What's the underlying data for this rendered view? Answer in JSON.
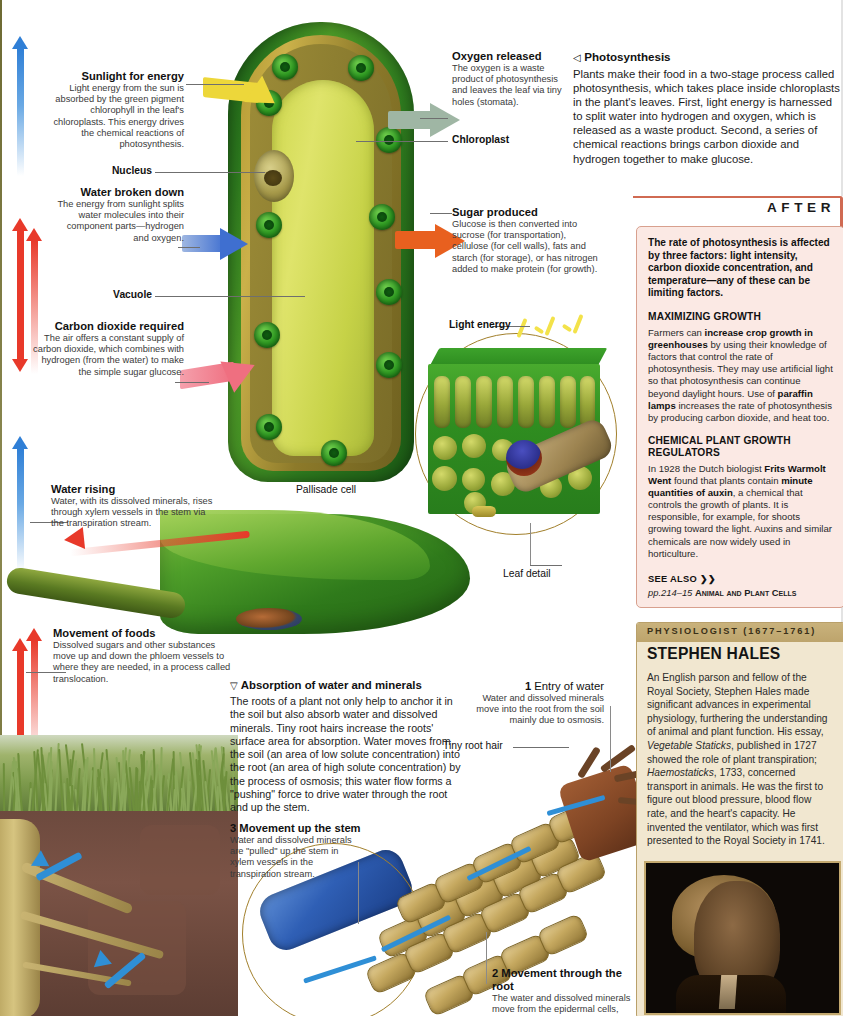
{
  "left_annotations": [
    {
      "id": "sunlight",
      "heading": "Sunlight for energy",
      "body": "Light energy from the sun is absorbed by the green pigment chlorophyll in the leaf's chloroplasts. This energy drives the chemical reactions of photosynthesis."
    },
    {
      "id": "water_broken_down",
      "heading": "Water broken down",
      "body": "The energy from sunlight splits water molecules into their component parts—hydrogen and oxygen."
    },
    {
      "id": "carbon_dioxide",
      "heading": "Carbon dioxide required",
      "body": "The air offers a constant supply of carbon dioxide, which combines with hydrogen (from the water) to make the simple sugar glucose."
    },
    {
      "id": "water_rising",
      "heading": "Water rising",
      "body": "Water, with its dissolved minerals, rises through xylem vessels in the stem via the transpiration stream."
    },
    {
      "id": "movement_of_foods",
      "heading": "Movement of foods",
      "body": "Dissolved sugars and other substances move up and down the phloem vessels to where they are needed, in a process called translocation."
    }
  ],
  "right_annotations": [
    {
      "id": "oxygen_released",
      "heading": "Oxygen released",
      "body": "The oxygen is a waste product of photosynthesis and leaves the leaf via tiny holes (stomata)."
    },
    {
      "id": "sugar_produced",
      "heading": "Sugar produced",
      "body": "Glucose is then converted into sucrose (for transportation), cellulose (for cell walls), fats and starch (for storage), or has nitrogen added to make protein (for growth)."
    }
  ],
  "pointer_labels": {
    "nucleus": "Nucleus",
    "vacuole": "Vacuole",
    "chloroplast": "Chloroplast",
    "light_energy": "Light energy",
    "pallisade_cell": "Pallisade cell",
    "leaf_detail": "Leaf detail",
    "tiny_root_hair": "Tiny root hair"
  },
  "intro": {
    "marker": "◁",
    "title": "Photosynthesis",
    "body": "Plants make their food in a two-stage process called photosynthesis, which takes place inside chloroplasts in the plant's leaves. First, light energy is harnessed to split water into hydrogen and oxygen, which is released as a waste product. Second, a series of chemical reactions brings carbon dioxide and hydrogen together to make glucose."
  },
  "absorption": {
    "marker": "▽",
    "title": "Absorption of water and minerals",
    "body": "The roots of a plant not only help to anchor it in the soil but also absorb water and dissolved minerals. Tiny root hairs increase the roots' surface area for absorption. Water moves from the soil (an area of low solute concentration) into the root (an area of high solute concentration) by the process of osmosis; this water flow forms a \"pushing\" force to drive water through the root and up the stem."
  },
  "numbered_steps": [
    {
      "number": "1",
      "heading": "Entry of water",
      "body": "Water and dissolved minerals move into the root from the soil mainly due to osmosis."
    },
    {
      "number": "2",
      "heading": "Movement through the root",
      "body": "The water and dissolved minerals move from the epidermal cells, through the cortex and into"
    },
    {
      "number": "3",
      "heading": "Movement up the stem",
      "body": "Water and dissolved minerals are \"pulled\" up the stem in xylem vessels in the transpiration stream."
    }
  ],
  "after_panel": {
    "tab_label": "AFTER",
    "lead": "The rate of photosynthesis is affected by three factors: light intensity, carbon dioxide concentration, and temperature—any of these can be limiting factors.",
    "sections": [
      {
        "heading": "MAXIMIZING GROWTH",
        "body_parts": [
          {
            "text": "Farmers can ",
            "bold": false
          },
          {
            "text": "increase crop growth in greenhouses",
            "bold": true
          },
          {
            "text": " by using their knowledge of factors that control the rate of photosynthesis. They may use artificial light so that photosynthesis can continue beyond daylight hours. Use of ",
            "bold": false
          },
          {
            "text": "paraffin lamps",
            "bold": true
          },
          {
            "text": " increases the rate of photosynthesis by producing carbon dioxide, and heat too.",
            "bold": false
          }
        ]
      },
      {
        "heading": "CHEMICAL PLANT GROWTH REGULATORS",
        "body_parts": [
          {
            "text": "In 1928 the Dutch biologist ",
            "bold": false
          },
          {
            "text": "Frits Warmolt Went",
            "bold": true
          },
          {
            "text": " found that plants contain ",
            "bold": false
          },
          {
            "text": "minute quantities of auxin",
            "bold": true
          },
          {
            "text": ", a chemical that controls the growth of plants. It is responsible, for example, for shoots growing toward the light. Auxins and similar chemicals are now widely used in horticulture.",
            "bold": false
          }
        ]
      }
    ],
    "see_also_label": "SEE ALSO ❯❯",
    "see_also_ref": "pp.214–15",
    "see_also_title": "Animal and Plant Cells"
  },
  "biography": {
    "kicker": "PHYSIOLOGIST (1677–1761)",
    "name": "STEPHEN HALES",
    "body_parts": [
      {
        "text": "An English parson and fellow of the Royal Society, Stephen Hales made significant advances in experimental physiology, furthering the understanding of animal and plant function. His essay, ",
        "italic": false
      },
      {
        "text": "Vegetable Staticks",
        "italic": true
      },
      {
        "text": ", published in 1727 showed the role of plant transpiration; ",
        "italic": false
      },
      {
        "text": "Haemostaticks",
        "italic": true
      },
      {
        "text": ", 1733, concerned transport in animals. He was the first to figure out blood pressure, blood flow rate, and the heart's capacity. He invented the ventilator, which was first presented to the Royal Society in 1741.",
        "italic": false
      }
    ],
    "portrait_alt": "portrait-stephen-hales"
  },
  "colors": {
    "after_accent": "#d06a52",
    "after_bg": "#fbe9e4",
    "bio_bg": "#f1e7d0",
    "bio_header": "#c9b27c",
    "arrow_blue": "#2f7fd6",
    "arrow_red": "#e8392a",
    "arrow_yellow": "#edd73a",
    "arrow_orange": "#e8601f",
    "arrow_pink": "#ef6f80",
    "arrow_gray_green": "#9fb6a4",
    "leaf_green": "#2f8d20"
  }
}
